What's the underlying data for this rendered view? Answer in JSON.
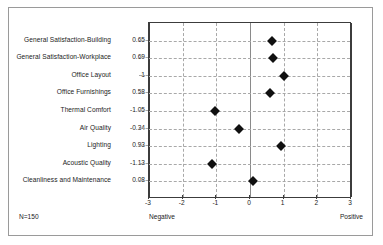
{
  "chart_data": {
    "type": "scatter",
    "title": "",
    "xlabel": "",
    "ylabel": "",
    "xlim": [
      -3,
      3
    ],
    "xticks": [
      -3,
      -2,
      -1,
      0,
      1,
      2,
      3
    ],
    "xtick_labels": [
      "-3",
      "-2",
      "-1",
      "0",
      "1",
      "2",
      "3"
    ],
    "grid": true,
    "legend": null,
    "marker": "diamond",
    "marker_color": "#101010",
    "axis_low_label": "Negative",
    "axis_high_label": "Positive",
    "sample_size_label": "N=150",
    "categories": [
      "General Satisfaction-Building",
      "General Satisfaction-Workplace",
      "Office Layout",
      "Office Furnishings",
      "Thermal Comfort",
      "Air Quality",
      "Lighting",
      "Acoustic Quality",
      "Cleanliness and Maintenance"
    ],
    "values": [
      0.65,
      0.69,
      1,
      0.58,
      -1.05,
      -0.34,
      0.93,
      -1.13,
      0.08
    ],
    "value_labels": [
      "0.65",
      "0.69",
      "1",
      "0.58",
      "-1.05",
      "-0.34",
      "0.93",
      "-1.13",
      "0.08"
    ]
  },
  "colors": {
    "marker": "#101010",
    "frame_border": "#9a9a9a",
    "axis": "#3c3c3c",
    "gridline": "#a8a8a8",
    "zero_line": "#8a8a8a",
    "text": "#1b1b1b",
    "background": "#ffffff"
  }
}
